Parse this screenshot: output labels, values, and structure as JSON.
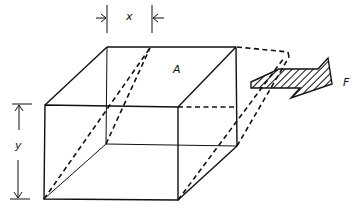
{
  "diagram": {
    "type": "shear-deformation-cube",
    "labels": {
      "x": "x",
      "y": "y",
      "area": "A",
      "force": "F"
    },
    "colors": {
      "ink": "#111111",
      "background": "#ffffff"
    }
  }
}
